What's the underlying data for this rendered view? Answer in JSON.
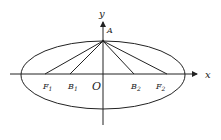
{
  "diagram": {
    "type": "ellipse-coordinate-figure",
    "axes": {
      "x_label": "x",
      "y_label": "y",
      "origin_label": "O"
    },
    "points": [
      {
        "id": "A",
        "label": "A",
        "sub": ""
      },
      {
        "id": "F1",
        "label": "F",
        "sub": "1"
      },
      {
        "id": "B1",
        "label": "B",
        "sub": "1"
      },
      {
        "id": "B2",
        "label": "B",
        "sub": "2"
      },
      {
        "id": "F2",
        "label": "F",
        "sub": "2"
      }
    ],
    "segments": [
      "AF1",
      "AB1",
      "AB2",
      "AF2"
    ],
    "colors": {
      "stroke": "#222222",
      "background": "#ffffff"
    }
  }
}
